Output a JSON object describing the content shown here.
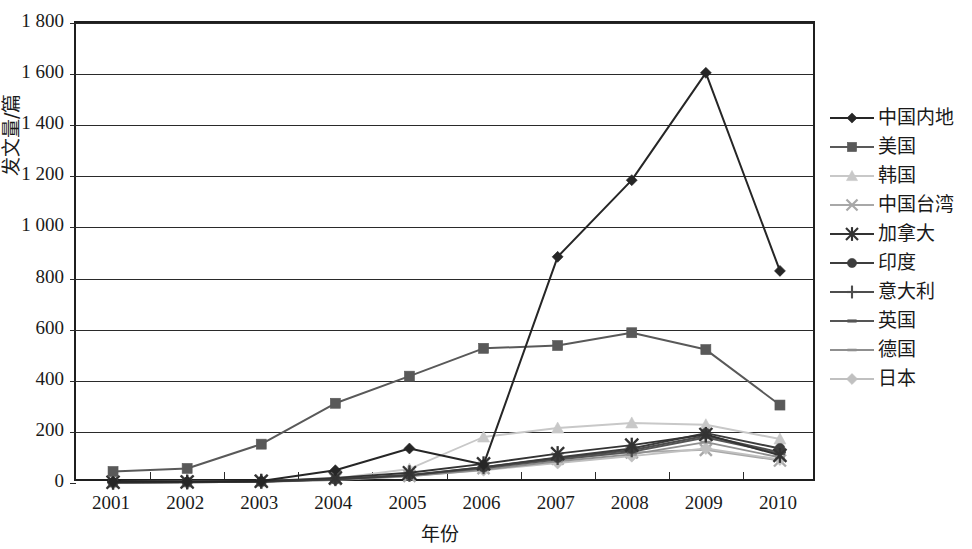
{
  "chart_data": {
    "type": "line",
    "title": "",
    "xlabel": "年份",
    "ylabel": "发文量/篇",
    "x": [
      2001,
      2002,
      2003,
      2004,
      2005,
      2006,
      2007,
      2008,
      2009,
      2010
    ],
    "categories": [
      "2001",
      "2002",
      "2003",
      "2004",
      "2005",
      "2006",
      "2007",
      "2008",
      "2009",
      "2010"
    ],
    "xtick_labels": [
      "2001",
      "2002",
      "2003",
      "2004",
      "2005",
      "2006",
      "2007",
      "2008",
      "2009",
      "2010"
    ],
    "ytick_labels": [
      "0",
      "200",
      "400",
      "600",
      "800",
      "1 000",
      "1 200",
      "1 400",
      "1 600",
      "1 800"
    ],
    "ytick_values": [
      0,
      200,
      400,
      600,
      800,
      1000,
      1200,
      1400,
      1600,
      1800
    ],
    "ylim": [
      0,
      1800
    ],
    "ytick_step": 200,
    "grid": "horizontal",
    "legend_position": "right",
    "series": [
      {
        "name": "中国内地",
        "marker": "diamond",
        "color": "#262626",
        "values": [
          5,
          6,
          8,
          50,
          135,
          72,
          885,
          1185,
          1605,
          830
        ]
      },
      {
        "name": "美国",
        "marker": "square",
        "color": "#595959",
        "values": [
          45,
          57,
          152,
          312,
          418,
          527,
          538,
          588,
          522,
          305
        ]
      },
      {
        "name": "韩国",
        "marker": "triangle",
        "color": "#c8c8c8",
        "values": [
          2,
          3,
          5,
          18,
          55,
          180,
          215,
          235,
          228,
          172
        ]
      },
      {
        "name": "中国台湾",
        "marker": "cross",
        "color": "#a8a8a8",
        "values": [
          4,
          5,
          8,
          16,
          28,
          58,
          95,
          120,
          130,
          88
        ]
      },
      {
        "name": "加拿大",
        "marker": "star",
        "color": "#333333",
        "values": [
          3,
          4,
          7,
          20,
          40,
          75,
          115,
          148,
          190,
          108
        ]
      },
      {
        "name": "印度",
        "marker": "circle",
        "color": "#3d3d3d",
        "values": [
          2,
          3,
          5,
          14,
          30,
          62,
          100,
          135,
          195,
          135
        ]
      },
      {
        "name": "意大利",
        "marker": "plus",
        "color": "#4d4d4d",
        "values": [
          3,
          4,
          6,
          15,
          32,
          62,
          98,
          128,
          185,
          120
        ]
      },
      {
        "name": "英国",
        "marker": "dash",
        "color": "#555555",
        "values": [
          3,
          4,
          6,
          14,
          30,
          58,
          92,
          122,
          178,
          115
        ]
      },
      {
        "name": "德国",
        "marker": "smalldash",
        "color": "#8f8f8f",
        "values": [
          2,
          3,
          5,
          12,
          26,
          52,
          85,
          112,
          160,
          100
        ]
      },
      {
        "name": "日本",
        "marker": "smalldiamond",
        "color": "#c0c0c0",
        "values": [
          4,
          5,
          7,
          14,
          28,
          50,
          78,
          105,
          135,
          92
        ]
      }
    ]
  },
  "legend": {
    "items": [
      {
        "label": "中国内地"
      },
      {
        "label": "美国"
      },
      {
        "label": "韩国"
      },
      {
        "label": "中国台湾"
      },
      {
        "label": "加拿大"
      },
      {
        "label": "印度"
      },
      {
        "label": "意大利"
      },
      {
        "label": "英国"
      },
      {
        "label": "德国"
      },
      {
        "label": "日本"
      }
    ]
  },
  "axes": {
    "y_title": "发文量/篇",
    "x_title": "年份"
  }
}
